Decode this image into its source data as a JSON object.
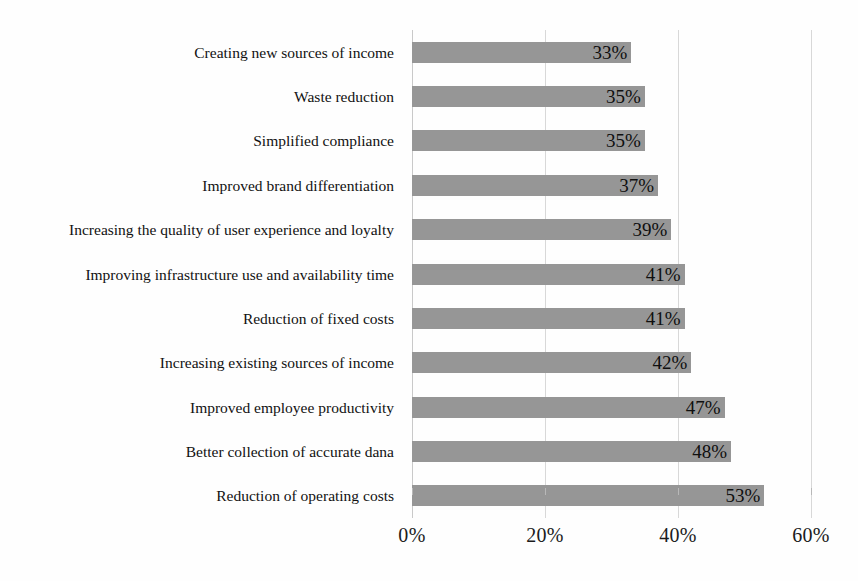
{
  "chart_data": {
    "type": "bar",
    "orientation": "horizontal",
    "title": "",
    "xlabel": "",
    "ylabel": "",
    "xlim": [
      0,
      60
    ],
    "xtick_labels": [
      "0%",
      "20%",
      "40%",
      "60%"
    ],
    "xtick_values": [
      0,
      20,
      40,
      60
    ],
    "grid": true,
    "legend": false,
    "value_label_suffix": "%",
    "value_label_position": "inside-end",
    "bar_color": "#969696",
    "gridline_color": "#d8d8d8",
    "text_color": "#111111",
    "background_color": "#fefefe",
    "categories": [
      "Creating new sources of income",
      "Waste reduction",
      "Simplified compliance",
      "Improved brand differentiation",
      "Increasing the quality of user experience and loyalty",
      "Improving infrastructure use and availability time",
      "Reduction of fixed costs",
      "Increasing existing sources of income",
      "Improved employee productivity",
      "Better collection of accurate dana",
      "Reduction of operating costs"
    ],
    "values": [
      33,
      35,
      35,
      37,
      39,
      41,
      41,
      42,
      47,
      48,
      53
    ],
    "value_labels": [
      "33%",
      "35%",
      "35%",
      "37%",
      "39%",
      "41%",
      "41%",
      "42%",
      "47%",
      "48%",
      "53%"
    ]
  }
}
